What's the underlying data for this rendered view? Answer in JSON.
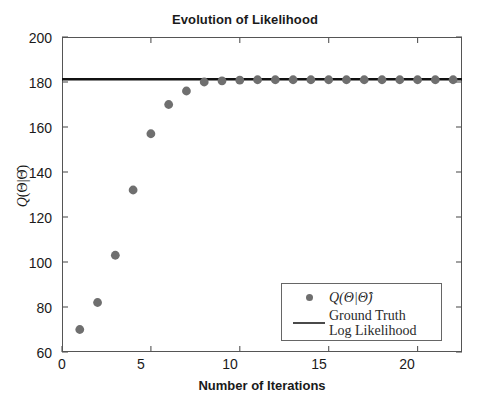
{
  "chart_data": {
    "type": "scatter",
    "title": "Evolution of Likelihood",
    "xlabel": "Number of Iterations",
    "ylabel": "Q(Θ|Θ̂)",
    "xlim": [
      0,
      22.5
    ],
    "ylim": [
      60,
      200
    ],
    "xticks": [
      0,
      5,
      10,
      15,
      20
    ],
    "yticks": [
      60,
      80,
      100,
      120,
      140,
      160,
      180,
      200
    ],
    "grid": false,
    "legend_position": "lower right",
    "series": [
      {
        "name": "Q(Θ|Θ̂)",
        "type": "scatter",
        "color": "#6f6f6f",
        "marker": "circle",
        "x": [
          1,
          2,
          3,
          4,
          5,
          6,
          7,
          8,
          9,
          10,
          11,
          12,
          13,
          14,
          15,
          16,
          17,
          18,
          19,
          20,
          21,
          22
        ],
        "values": [
          70,
          82,
          103,
          132,
          157,
          170,
          176,
          180,
          180.5,
          180.8,
          181,
          181,
          181,
          181,
          181,
          181,
          181,
          181,
          181,
          181,
          181,
          181
        ]
      },
      {
        "name": "Ground Truth Log Likelihood",
        "type": "line",
        "color": "#111111",
        "constant_value": 181.2
      }
    ]
  },
  "title": {
    "text": "Evolution of Likelihood"
  },
  "axes": {
    "x": {
      "label": "Number of Iterations",
      "tick_labels": [
        "0",
        "5",
        "10",
        "15",
        "20"
      ]
    },
    "y": {
      "label_main": "Q",
      "label_args": "(Θ|Θ̂)",
      "tick_labels": [
        "200",
        "180",
        "160",
        "140",
        "120",
        "100",
        "80",
        "60"
      ]
    }
  },
  "legend": {
    "entries": [
      {
        "label": "Q(Θ|Θ̂)",
        "symbol": "dot-marker"
      },
      {
        "label_line1": "Ground Truth",
        "label_line2": "Log Likelihood",
        "symbol": "solid-line"
      }
    ]
  }
}
